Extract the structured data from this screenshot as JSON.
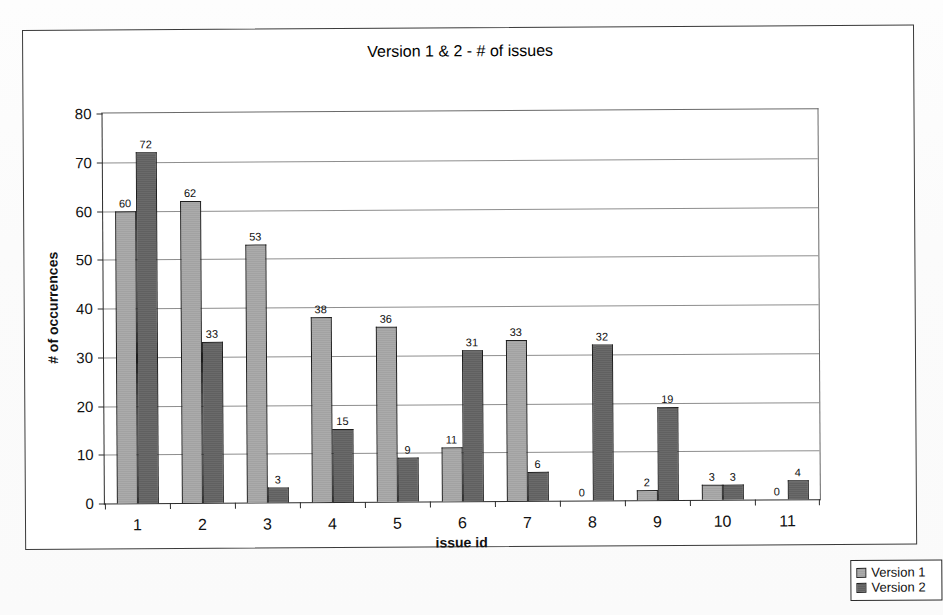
{
  "chart_data": {
    "type": "bar",
    "title": "Version 1 & 2 - # of issues",
    "xlabel": "issue id",
    "ylabel": "# of occurrences",
    "categories": [
      "1",
      "2",
      "3",
      "4",
      "5",
      "6",
      "7",
      "8",
      "9",
      "10",
      "11"
    ],
    "series": [
      {
        "name": "Version 1",
        "color": "#a8a8a8",
        "values": [
          60,
          62,
          53,
          38,
          36,
          11,
          33,
          0,
          2,
          3,
          0
        ]
      },
      {
        "name": "Version 2",
        "color": "#646464",
        "values": [
          72,
          33,
          3,
          15,
          9,
          31,
          6,
          32,
          19,
          3,
          4
        ]
      }
    ],
    "ylim": [
      0,
      80
    ],
    "yticks": [
      0,
      10,
      20,
      30,
      40,
      50,
      60,
      70,
      80
    ],
    "ytick_labels": [
      "0",
      "10",
      "20",
      "30",
      "40",
      "50",
      "60",
      "70",
      "80"
    ],
    "grid": true,
    "grid_axis": "y",
    "legend_position": "bottom-right-outside",
    "data_labels": true
  },
  "legend": {
    "items": [
      {
        "label": "Version 1",
        "swatch": "series-1-swatch"
      },
      {
        "label": "Version 2",
        "swatch": "series-2-swatch"
      }
    ]
  }
}
